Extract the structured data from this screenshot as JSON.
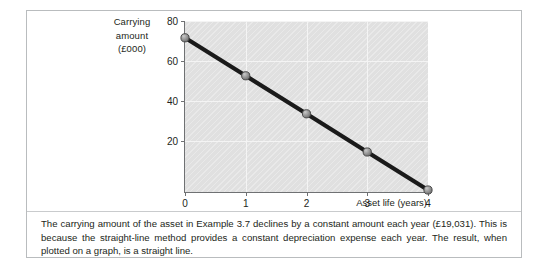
{
  "figure": {
    "caption": "The carrying amount of the asset in Example 3.7 declines by a constant amount each year (£19,031). This is because the straight-line method provides a constant depreciation expense each year. The result, when plotted on a graph, is a straight line."
  },
  "chart_data": {
    "type": "line",
    "title": "",
    "xlabel": "Asset life (years)",
    "ylabel_lines": [
      "Carrying",
      "amount",
      "(£000)"
    ],
    "ylabel": "Carrying amount (£000)",
    "x": [
      0,
      1,
      2,
      3,
      4
    ],
    "values": [
      77.1,
      58.1,
      39.1,
      20.0,
      1.0
    ],
    "series": [
      {
        "name": "Carrying amount",
        "values": [
          77.1,
          58.1,
          39.1,
          20.0,
          1.0
        ]
      }
    ],
    "xtick_labels": [
      "0",
      "1",
      "2",
      "3",
      "4"
    ],
    "ytick_labels": [
      "20",
      "40",
      "60",
      "80"
    ],
    "yticks": [
      20,
      40,
      60,
      80
    ],
    "xlim": [
      0,
      4
    ],
    "ylim": [
      0,
      85.5
    ],
    "grid": true,
    "legend": "none",
    "line_color": "#1a1a1a",
    "marker_color": "#8c8c8c",
    "plot_background": "#e0e0e0",
    "axis_color": "#6f7173"
  }
}
